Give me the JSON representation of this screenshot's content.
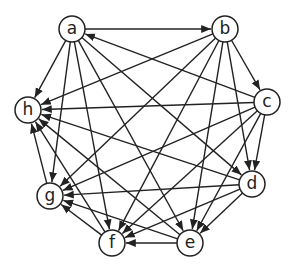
{
  "diagram": {
    "type": "directed-graph",
    "stroke_color": "#222222",
    "background": "#ffffff",
    "node_radius": 13,
    "nodes": [
      {
        "id": "a",
        "label": "a",
        "x": 72,
        "y": 29
      },
      {
        "id": "b",
        "label": "b",
        "x": 225,
        "y": 29
      },
      {
        "id": "c",
        "label": "c",
        "x": 267,
        "y": 102
      },
      {
        "id": "d",
        "label": "d",
        "x": 252,
        "y": 184
      },
      {
        "id": "e",
        "label": "e",
        "x": 190,
        "y": 243
      },
      {
        "id": "f",
        "label": "f",
        "x": 112,
        "y": 243
      },
      {
        "id": "g",
        "label": "g",
        "x": 50,
        "y": 196
      },
      {
        "id": "h",
        "label": "h",
        "x": 28,
        "y": 110
      }
    ],
    "edges": [
      {
        "from": "a",
        "to": "b"
      },
      {
        "from": "c",
        "to": "a"
      },
      {
        "from": "a",
        "to": "h"
      },
      {
        "from": "a",
        "to": "g"
      },
      {
        "from": "a",
        "to": "f"
      },
      {
        "from": "a",
        "to": "e"
      },
      {
        "from": "a",
        "to": "d"
      },
      {
        "from": "b",
        "to": "c"
      },
      {
        "from": "b",
        "to": "h"
      },
      {
        "from": "b",
        "to": "g"
      },
      {
        "from": "b",
        "to": "f"
      },
      {
        "from": "b",
        "to": "e"
      },
      {
        "from": "b",
        "to": "d"
      },
      {
        "from": "c",
        "to": "h"
      },
      {
        "from": "c",
        "to": "g"
      },
      {
        "from": "c",
        "to": "f"
      },
      {
        "from": "c",
        "to": "e"
      },
      {
        "from": "c",
        "to": "d"
      },
      {
        "from": "d",
        "to": "h"
      },
      {
        "from": "d",
        "to": "g"
      },
      {
        "from": "d",
        "to": "e"
      },
      {
        "from": "d",
        "to": "f"
      },
      {
        "from": "e",
        "to": "h"
      },
      {
        "from": "e",
        "to": "f"
      },
      {
        "from": "f",
        "to": "h"
      },
      {
        "from": "f",
        "to": "g"
      },
      {
        "from": "g",
        "to": "h"
      },
      {
        "from": "e",
        "to": "g"
      }
    ]
  }
}
